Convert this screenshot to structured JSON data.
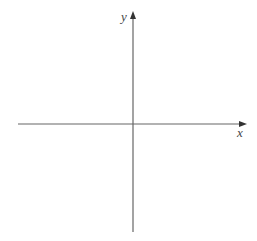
{
  "diagram": {
    "type": "coordinate-axes",
    "x_axis": {
      "label": "x",
      "color": "#666666"
    },
    "y_axis": {
      "label": "y",
      "color": "#666666"
    },
    "origin": [
      133,
      124
    ],
    "background": "#ffffff"
  }
}
